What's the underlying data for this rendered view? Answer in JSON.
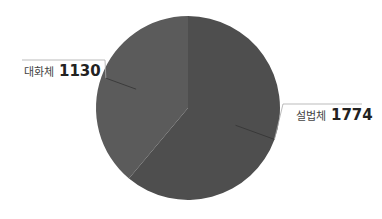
{
  "chart_data": {
    "type": "pie",
    "title": "",
    "categories": [
      "설법체",
      "대화체"
    ],
    "values": [
      1774,
      1130
    ],
    "colors": [
      "#4e4e4e",
      "#5b5b5b"
    ],
    "start_angle_deg": 0,
    "direction": "clockwise",
    "legend": "none",
    "data_labels": "outside with leader lines"
  },
  "labels": [
    {
      "category": "설법체",
      "value": "1774"
    },
    {
      "category": "대화체",
      "value": "1130"
    }
  ]
}
